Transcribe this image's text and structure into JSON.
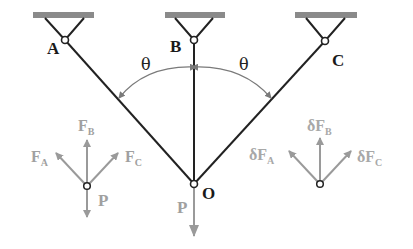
{
  "diagram": {
    "colors": {
      "bar": "#222222",
      "support": "#8a8a8a",
      "force": "#9a9a9a",
      "arc": "#7a7a7a",
      "label_dark": "#1a1a1a",
      "label_light": "#a0a0a0"
    },
    "supports": [
      {
        "id": "A",
        "label": "A"
      },
      {
        "id": "B",
        "label": "B"
      },
      {
        "id": "C",
        "label": "C"
      }
    ],
    "joint_label": "O",
    "load_label": "P",
    "angle_labels": [
      "θ",
      "θ"
    ],
    "fbd_left": {
      "forces": {
        "FA": {
          "main": "F",
          "sub": "A"
        },
        "FB": {
          "main": "F",
          "sub": "B"
        },
        "FC": {
          "main": "F",
          "sub": "C"
        }
      },
      "load": "P"
    },
    "fbd_right": {
      "forces": {
        "dFA": {
          "main": "δF",
          "sub": "A"
        },
        "dFB": {
          "main": "δF",
          "sub": "B"
        },
        "dFC": {
          "main": "δF",
          "sub": "C"
        }
      }
    }
  }
}
